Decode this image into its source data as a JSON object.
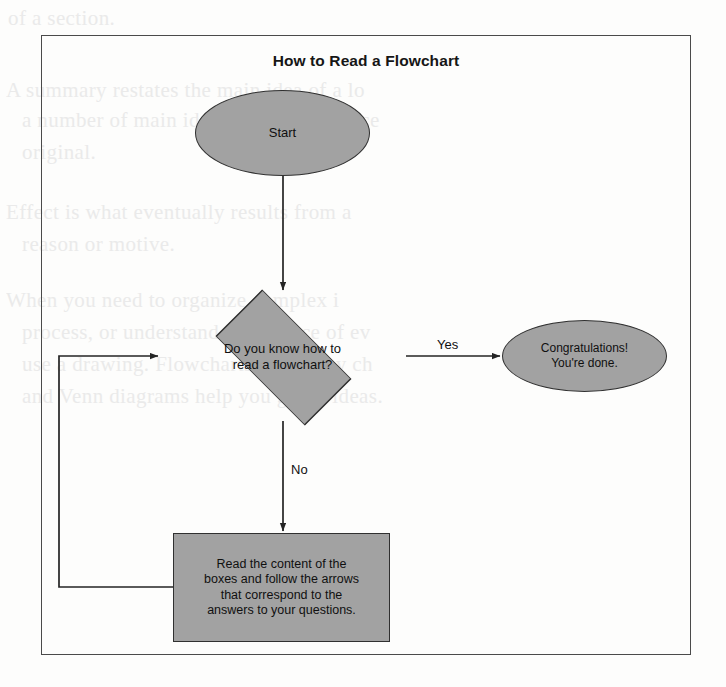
{
  "figure": {
    "title": "How to Read a Flowchart",
    "frame_color": "#4a4a4a",
    "node_fill": "#a2a2a2",
    "node_stroke": "#303030",
    "page_background": "#fdfdfc"
  },
  "nodes": [
    {
      "id": "start",
      "shape": "ellipse",
      "label": "Start"
    },
    {
      "id": "decision",
      "shape": "diamond",
      "label": "Do you know how to read a flowchart?",
      "lines": [
        "Do you know how to",
        "read a flowchart?"
      ]
    },
    {
      "id": "congrats",
      "shape": "ellipse",
      "label": "Congratulations! You're done.",
      "lines": [
        "Congratulations!",
        "You're done."
      ]
    },
    {
      "id": "read",
      "shape": "rectangle",
      "label": "Read the content of the boxes and follow the arrows that correspond to the answers to your questions.",
      "lines": [
        "Read the content of the",
        "boxes and follow the arrows",
        "that correspond to the",
        "answers to your questions."
      ]
    }
  ],
  "edges": [
    {
      "id": "start-to-decision",
      "from": "start",
      "to": "decision",
      "label": ""
    },
    {
      "id": "decision-yes",
      "from": "decision",
      "to": "congrats",
      "label": "Yes"
    },
    {
      "id": "decision-no",
      "from": "decision",
      "to": "read",
      "label": "No"
    },
    {
      "id": "read-loop-back",
      "from": "read",
      "to": "decision",
      "label": ""
    }
  ],
  "edge_labels": {
    "yes": "Yes",
    "no": "No"
  },
  "background_bleed": [
    {
      "text": "of a section.",
      "x": 8,
      "y": 6
    },
    {
      "text": "A summary restates the main idea of a lo",
      "x": 6,
      "y": 78
    },
    {
      "text": "a number of main ideas in a longer piece",
      "x": 22,
      "y": 108
    },
    {
      "text": "original.",
      "x": 22,
      "y": 140
    },
    {
      "text": "Effect is what eventually results from a",
      "x": 6,
      "y": 200
    },
    {
      "text": "reason or motive.",
      "x": 22,
      "y": 232
    },
    {
      "text": "When you need to organize complex i",
      "x": 6,
      "y": 288
    },
    {
      "text": "process, or understand a sequence of ev",
      "x": 22,
      "y": 320
    },
    {
      "text": "use a drawing. Flowcharts, hierarchy ch",
      "x": 22,
      "y": 352
    },
    {
      "text": "and Venn diagrams help you graph ideas.",
      "x": 22,
      "y": 384
    }
  ]
}
